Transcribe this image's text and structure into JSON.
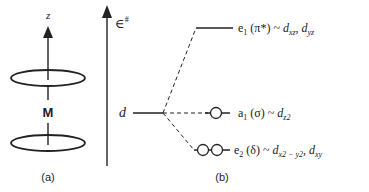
{
  "panel_a": {
    "axis_label": "z",
    "metal_label": "M",
    "caption": "(a)"
  },
  "panel_b": {
    "energy_label": "∈",
    "energy_superscript": "#",
    "d_label": "d",
    "caption": "(b)",
    "levels": [
      {
        "symmetry": "e",
        "symmetry_sub": "1",
        "bond_type": "(π*)",
        "tilde": "~",
        "orbitals": [
          {
            "base": "d",
            "sub": "xz"
          },
          {
            "base": "d",
            "sub": "yz"
          }
        ],
        "electrons_shown": 0
      },
      {
        "symmetry": "a",
        "symmetry_sub": "1",
        "bond_type": "(σ)",
        "tilde": "~",
        "orbitals": [
          {
            "base": "d",
            "sub": "z2"
          }
        ],
        "electrons_shown": 1
      },
      {
        "symmetry": "e",
        "symmetry_sub": "2",
        "bond_type": "(δ)",
        "tilde": "~",
        "orbitals": [
          {
            "base": "d",
            "sub": "x2 − y2"
          },
          {
            "base": "d",
            "sub": "xy"
          }
        ],
        "electrons_shown": 2
      }
    ]
  },
  "colors": {
    "line": "#222222",
    "background": "#ffffff"
  }
}
